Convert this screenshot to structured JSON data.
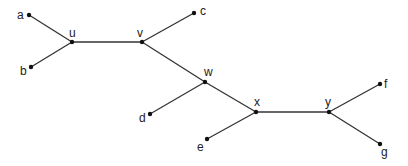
{
  "diagram": {
    "type": "tree",
    "nodes": [
      {
        "id": "a",
        "label": "a",
        "x": 29,
        "y": 15,
        "lx": 17,
        "ly": 19,
        "kind": "leaf"
      },
      {
        "id": "b",
        "label": "b",
        "x": 31,
        "y": 67,
        "lx": 20,
        "ly": 75,
        "kind": "leaf"
      },
      {
        "id": "u",
        "label": "u",
        "x": 72,
        "y": 42,
        "lx": 69,
        "ly": 37,
        "kind": "internal"
      },
      {
        "id": "v",
        "label": "v",
        "x": 142,
        "y": 42,
        "lx": 137,
        "ly": 37,
        "kind": "internal"
      },
      {
        "id": "c",
        "label": "c",
        "x": 194,
        "y": 13,
        "lx": 200,
        "ly": 15,
        "kind": "leaf"
      },
      {
        "id": "w",
        "label": "w",
        "x": 205,
        "y": 82,
        "lx": 204,
        "ly": 76,
        "kind": "internal"
      },
      {
        "id": "d",
        "label": "d",
        "x": 150,
        "y": 114,
        "lx": 139,
        "ly": 122,
        "kind": "leaf"
      },
      {
        "id": "x",
        "label": "x",
        "x": 256,
        "y": 112,
        "lx": 254,
        "ly": 106,
        "kind": "internal"
      },
      {
        "id": "e",
        "label": "e",
        "x": 207,
        "y": 139,
        "lx": 197,
        "ly": 151,
        "kind": "leaf"
      },
      {
        "id": "y",
        "label": "y",
        "x": 329,
        "y": 112,
        "lx": 325,
        "ly": 106,
        "kind": "internal"
      },
      {
        "id": "f",
        "label": "f",
        "x": 380,
        "y": 84,
        "lx": 384,
        "ly": 88,
        "kind": "leaf"
      },
      {
        "id": "g",
        "label": "g",
        "x": 380,
        "y": 144,
        "lx": 381,
        "ly": 156,
        "kind": "leaf"
      }
    ],
    "edges": [
      [
        "a",
        "u"
      ],
      [
        "b",
        "u"
      ],
      [
        "u",
        "v"
      ],
      [
        "v",
        "c"
      ],
      [
        "v",
        "w"
      ],
      [
        "w",
        "d"
      ],
      [
        "w",
        "x"
      ],
      [
        "x",
        "e"
      ],
      [
        "x",
        "y"
      ],
      [
        "y",
        "f"
      ],
      [
        "y",
        "g"
      ]
    ]
  }
}
